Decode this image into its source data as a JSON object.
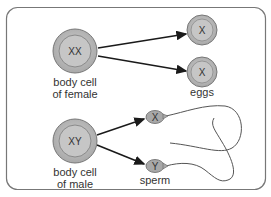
{
  "diagram": {
    "female": {
      "cell_label": "XX",
      "caption_line1": "body cell",
      "caption_line2": "of female"
    },
    "eggs": {
      "cells": [
        {
          "label": "X"
        },
        {
          "label": "X"
        }
      ],
      "caption": "eggs"
    },
    "male": {
      "cell_label": "XY",
      "caption_line1": "body cell",
      "caption_line2": "of male"
    },
    "sperm": {
      "cells": [
        {
          "label": "X"
        },
        {
          "label": "Y"
        }
      ],
      "caption": "sperm"
    },
    "colors": {
      "cell_fill": "#bdbdbd",
      "cell_inner": "#c9c9c9",
      "stroke": "#555555",
      "arrow": "#1a1a1a",
      "border": "#666666"
    }
  }
}
